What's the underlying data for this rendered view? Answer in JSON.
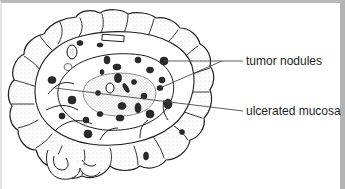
{
  "figure": {
    "labels": [
      {
        "id": "tumor-nodules",
        "text": "tumor nodules",
        "leader_count": 2
      },
      {
        "id": "ulcerated-mucosa",
        "text": "ulcerated mucosa",
        "leader_count": 1
      }
    ]
  },
  "colors": {
    "ink": "#1e1e1e",
    "leader": "#4a4a4a",
    "stipple": "#555555",
    "frame_top": "#b9b9b9",
    "frame_right": "#b3b3b3",
    "background": "#ffffff"
  }
}
